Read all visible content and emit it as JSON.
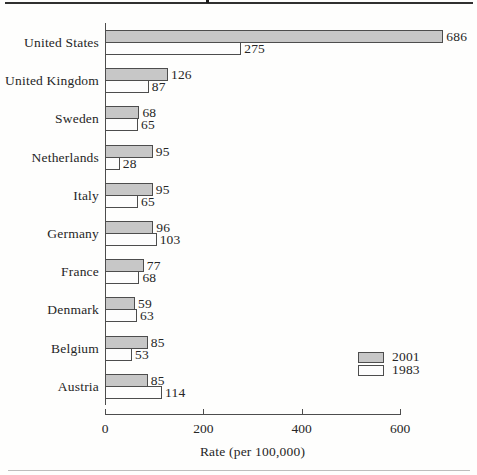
{
  "page": {
    "top_rule_color": "#303030",
    "bottom_rule_color": "#bdbdbd",
    "background": "#fefefd"
  },
  "chart_data": {
    "type": "bar",
    "orientation": "horizontal",
    "xlabel": "Rate (per 100,000)",
    "categories": [
      "United States",
      "United Kingdom",
      "Sweden",
      "Netherlands",
      "Italy",
      "Germany",
      "France",
      "Denmark",
      "Belgium",
      "Austria"
    ],
    "series": [
      {
        "name": "2001",
        "fill": "#c7c7c7",
        "values": [
          686,
          126,
          68,
          95,
          95,
          96,
          77,
          59,
          85,
          85
        ]
      },
      {
        "name": "1983",
        "fill": "#fdfdfd",
        "values": [
          275,
          87,
          65,
          28,
          65,
          103,
          68,
          63,
          53,
          114
        ]
      }
    ],
    "xticks": [
      0,
      200,
      400,
      600
    ],
    "xlim": [
      0,
      600
    ],
    "grid": false,
    "legend_position": "lower-right",
    "bar_border_color": "#4d4d4d",
    "axis_color": "#4d4d4d",
    "text_color": "#262626"
  }
}
